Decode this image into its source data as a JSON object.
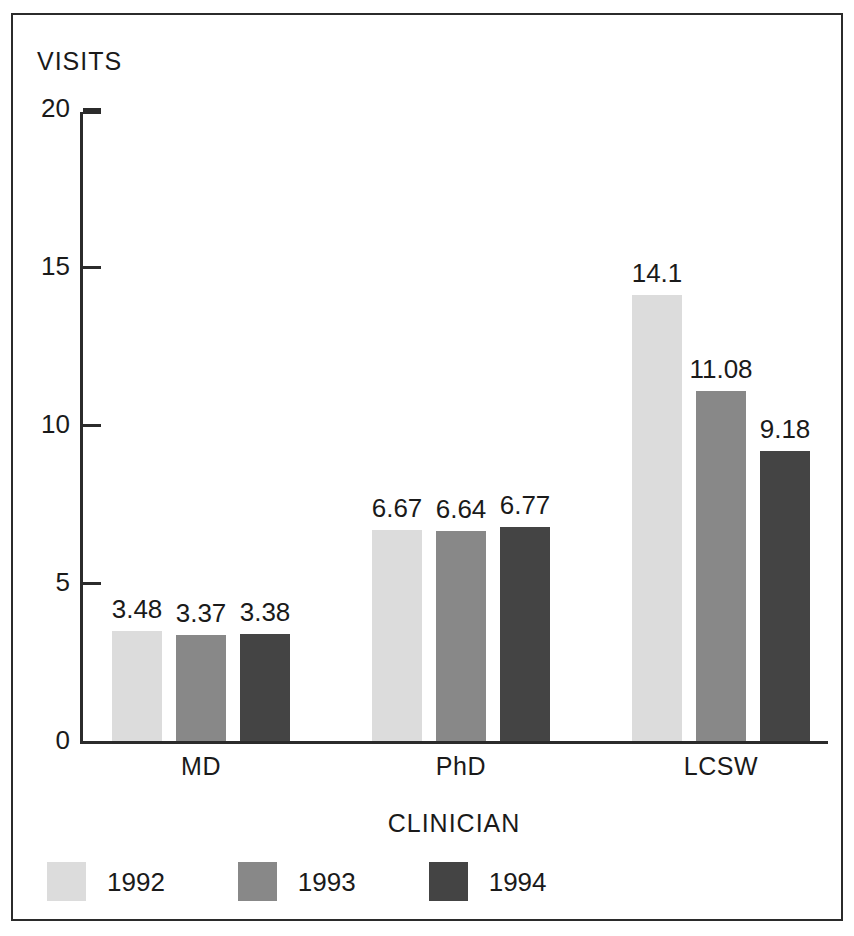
{
  "chart_data": {
    "type": "bar",
    "title": "",
    "xlabel": "CLINICIAN",
    "ylabel": "VISITS",
    "categories": [
      "MD",
      "PhD",
      "LCSW"
    ],
    "series": [
      {
        "name": "1992",
        "values": [
          3.48,
          6.67,
          14.1
        ],
        "color": "#dcdcdc"
      },
      {
        "name": "1993",
        "values": [
          3.37,
          6.64,
          11.08
        ],
        "color": "#888888"
      },
      {
        "name": "1994",
        "values": [
          3.38,
          6.77,
          9.18
        ],
        "color": "#444444"
      }
    ],
    "value_labels": [
      [
        "3.48",
        "3.37",
        "3.38"
      ],
      [
        "6.67",
        "6.64",
        "6.77"
      ],
      [
        "14.1",
        "11.08",
        "9.18"
      ]
    ],
    "ylim": [
      0,
      20
    ],
    "yticks": [
      0,
      5,
      10,
      15,
      20
    ],
    "ytick_labels": [
      "0",
      "5",
      "10",
      "15",
      "20"
    ],
    "grid": false,
    "legend_position": "bottom-left",
    "axis_color": "#2b2b2b",
    "text_color": "#1a1a1a",
    "background": "#ffffff"
  },
  "axes": {
    "y_title": "VISITS",
    "x_title": "CLINICIAN"
  },
  "ticks": {
    "y": [
      {
        "label": "20",
        "value": 20
      },
      {
        "label": "15",
        "value": 15
      },
      {
        "label": "10",
        "value": 10
      },
      {
        "label": "5",
        "value": 5
      },
      {
        "label": "0",
        "value": 0
      }
    ]
  },
  "groups": [
    {
      "label": "MD",
      "bars": [
        {
          "series": "1992",
          "value": 3.48,
          "label": "3.48"
        },
        {
          "series": "1993",
          "value": 3.37,
          "label": "3.37"
        },
        {
          "series": "1994",
          "value": 3.38,
          "label": "3.38"
        }
      ]
    },
    {
      "label": "PhD",
      "bars": [
        {
          "series": "1992",
          "value": 6.67,
          "label": "6.67"
        },
        {
          "series": "1993",
          "value": 6.64,
          "label": "6.64"
        },
        {
          "series": "1994",
          "value": 6.77,
          "label": "6.77"
        }
      ]
    },
    {
      "label": "LCSW",
      "bars": [
        {
          "series": "1992",
          "value": 14.1,
          "label": "14.1"
        },
        {
          "series": "1993",
          "value": 11.08,
          "label": "11.08"
        },
        {
          "series": "1994",
          "value": 9.18,
          "label": "9.18"
        }
      ]
    }
  ],
  "legend": {
    "items": [
      {
        "label": "1992",
        "color": "#dcdcdc"
      },
      {
        "label": "1993",
        "color": "#888888"
      },
      {
        "label": "1994",
        "color": "#444444"
      }
    ]
  }
}
